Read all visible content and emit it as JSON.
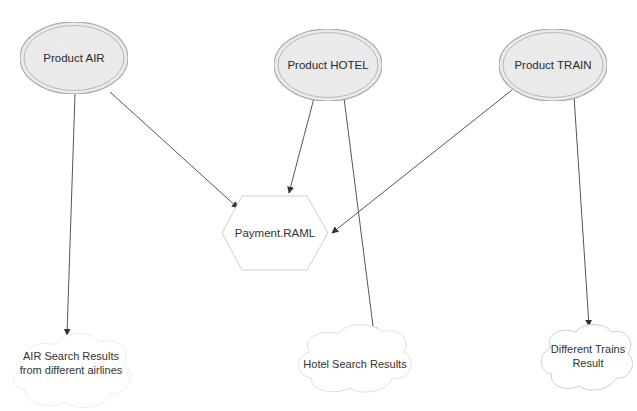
{
  "diagram": {
    "nodes": {
      "air": {
        "label": "Product AIR",
        "shape": "double-ellipse",
        "cx": 74,
        "cy": 58,
        "rx": 54,
        "ry": 36
      },
      "hotel": {
        "label": "Product HOTEL",
        "shape": "double-ellipse",
        "cx": 328,
        "cy": 65,
        "rx": 54,
        "ry": 36
      },
      "train": {
        "label": "Product TRAIN",
        "shape": "double-ellipse",
        "cx": 553,
        "cy": 65,
        "rx": 54,
        "ry": 36
      },
      "payment": {
        "label": "Payment.RAML",
        "shape": "hexagon",
        "cx": 275,
        "cy": 233
      },
      "air_results": {
        "label_line1": "AIR Search Results",
        "label_line2": "from different airlines",
        "shape": "cloud",
        "cx": 70,
        "cy": 380
      },
      "hotel_results": {
        "label": "Hotel Search Results",
        "shape": "cloud",
        "cx": 345,
        "cy": 364
      },
      "train_results": {
        "label_line1": "Different Trains",
        "label_line2": "Result",
        "shape": "cloud",
        "cx": 585,
        "cy": 360
      }
    },
    "edges": [
      {
        "from": "Product AIR",
        "to": "Payment.RAML"
      },
      {
        "from": "Product HOTEL",
        "to": "Payment.RAML"
      },
      {
        "from": "Product TRAIN",
        "to": "Payment.RAML"
      },
      {
        "from": "Product AIR",
        "to": "AIR Search Results from different airlines"
      },
      {
        "from": "Product HOTEL",
        "to": "Hotel Search Results"
      },
      {
        "from": "Product TRAIN",
        "to": "Different Trains Result"
      }
    ],
    "colors": {
      "ellipse_fill": "#ececec",
      "ellipse_stroke": "#a8a8a8",
      "shape_stroke": "#d0d0d0",
      "edge": "#555555",
      "text": "#333333"
    }
  }
}
